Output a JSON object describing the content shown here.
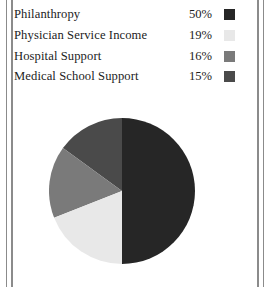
{
  "page": {
    "background_color": "#ffffff",
    "rule_color": "#8b8b8b"
  },
  "legend": {
    "rows": [
      {
        "label": "Philanthropy",
        "percent": "50%",
        "color": "#262626"
      },
      {
        "label": "Physician Service Income",
        "percent": "19%",
        "color": "#e8e8e8"
      },
      {
        "label": "Hospital Support",
        "percent": "16%",
        "color": "#7a7a7a"
      },
      {
        "label": "Medical School Support",
        "percent": "15%",
        "color": "#4a4a4a"
      }
    ]
  },
  "chart_data": {
    "type": "pie",
    "title": "",
    "categories": [
      "Philanthropy",
      "Physician Service Income",
      "Hospital Support",
      "Medical School Support"
    ],
    "values": [
      50,
      19,
      16,
      15
    ],
    "value_labels": [
      "50%",
      "19%",
      "16%",
      "15%"
    ],
    "colors": [
      "#262626",
      "#e8e8e8",
      "#7a7a7a",
      "#4a4a4a"
    ],
    "unit": "percent",
    "total": 100,
    "start_angle_deg": 0,
    "direction": "clockwise",
    "legend_position": "top",
    "grid": false,
    "geometry": {
      "cx": 73,
      "cy": 73,
      "r": 73
    },
    "slice_order_drawn": [
      "Philanthropy",
      "Medical School Support",
      "Hospital Support",
      "Physician Service Income"
    ]
  }
}
